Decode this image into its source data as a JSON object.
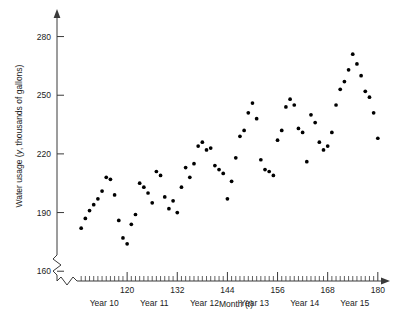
{
  "chart_data": {
    "type": "scatter",
    "title": "",
    "xlabel": "Month (t)",
    "ylabel": "Water usage (y, thousands of gallons)",
    "xlabel_text": "Month",
    "xlabel_var": "t",
    "ylabel_prefix": "Water usage (",
    "ylabel_var": "y",
    "ylabel_suffix": ", thousands of gallons)",
    "xlim": [
      108,
      181
    ],
    "ylim": [
      155,
      290
    ],
    "grid": false,
    "legend": null,
    "x_ticks": [
      120,
      132,
      144,
      156,
      168,
      180
    ],
    "x_tick_labels": [
      "120",
      "132",
      "144",
      "156",
      "168",
      "180"
    ],
    "x_minor_tick_step": 1,
    "y_ticks": [
      160,
      190,
      220,
      250,
      280
    ],
    "y_tick_labels": [
      "160",
      "190",
      "220",
      "250",
      "280"
    ],
    "axis_break_x": true,
    "axis_break_y": true,
    "group_labels": [
      {
        "label": "Year 10",
        "center": 114.5
      },
      {
        "label": "Year 11",
        "center": 126.5
      },
      {
        "label": "Year 12",
        "center": 138.5
      },
      {
        "label": "Year 13",
        "center": 150.5
      },
      {
        "label": "Year 14",
        "center": 162.5
      },
      {
        "label": "Year 15",
        "center": 174.5
      }
    ],
    "x": [
      109,
      110,
      111,
      112,
      113,
      114,
      115,
      116,
      117,
      118,
      119,
      120,
      121,
      122,
      123,
      124,
      125,
      126,
      127,
      128,
      129,
      130,
      131,
      132,
      133,
      134,
      135,
      136,
      137,
      138,
      139,
      140,
      141,
      142,
      143,
      144,
      145,
      146,
      147,
      148,
      149,
      150,
      151,
      152,
      153,
      154,
      155,
      156,
      157,
      158,
      159,
      160,
      161,
      162,
      163,
      164,
      165,
      166,
      167,
      168,
      169,
      170,
      171,
      172,
      173,
      174,
      175,
      176,
      177,
      178,
      179,
      180
    ],
    "y": [
      182,
      187,
      191,
      194,
      197,
      201,
      208,
      207,
      199,
      186,
      177,
      174,
      184,
      189,
      205,
      203,
      200,
      195,
      211,
      209,
      198,
      192,
      196,
      190,
      203,
      213,
      208,
      215,
      224,
      226,
      222,
      223,
      214,
      212,
      210,
      197,
      206,
      218,
      229,
      232,
      241,
      246,
      238,
      217,
      212,
      211,
      209,
      227,
      232,
      244,
      248,
      245,
      233,
      231,
      216,
      240,
      236,
      226,
      222,
      224,
      231,
      245,
      253,
      257,
      263,
      271,
      266,
      260,
      252,
      249,
      241,
      228
    ],
    "point_count": 72,
    "marker": "filled-circle",
    "marker_color": "#000000",
    "marker_size_px": 3
  }
}
